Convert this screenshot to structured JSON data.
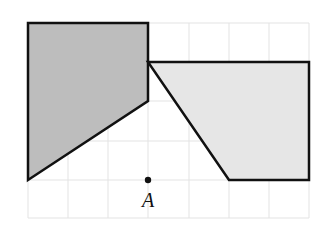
{
  "diagram": {
    "grid": {
      "x_lines": [
        28,
        68,
        108,
        148,
        189,
        229,
        269,
        309
      ],
      "y_lines": [
        23,
        62,
        101,
        141,
        180,
        218
      ],
      "color": "#e3e3e3"
    },
    "shapes": [
      {
        "name": "dark-quadrilateral",
        "points": "28,23 148,23 148,101 28,180",
        "fill": "#bdbdbd",
        "stroke": "#111111"
      },
      {
        "name": "light-quadrilateral",
        "points": "148,62 309,62 309,180 229,180",
        "fill": "#e6e6e6",
        "stroke": "#111111"
      }
    ],
    "point": {
      "label": "A",
      "x": 148,
      "y": 180
    }
  }
}
